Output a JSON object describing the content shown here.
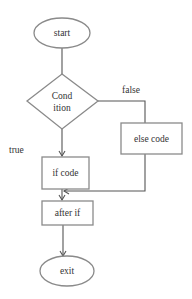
{
  "diagram": {
    "type": "flowchart",
    "nodes": {
      "start": {
        "shape": "ellipse",
        "label": "start"
      },
      "condition": {
        "shape": "diamond",
        "label_line1": "Cond",
        "label_line2": "ition"
      },
      "if_code": {
        "shape": "rect",
        "label": "if code"
      },
      "else_code": {
        "shape": "rect",
        "label": "else code"
      },
      "after_if": {
        "shape": "rect",
        "label": "after if"
      },
      "exit": {
        "shape": "ellipse",
        "label": "exit"
      }
    },
    "edges": [
      {
        "from": "start",
        "to": "condition",
        "label": ""
      },
      {
        "from": "condition",
        "to": "if_code",
        "label": "true"
      },
      {
        "from": "condition",
        "to": "else_code",
        "label": "false"
      },
      {
        "from": "if_code",
        "to": "after_if",
        "label": ""
      },
      {
        "from": "else_code",
        "to": "after_if",
        "label": ""
      },
      {
        "from": "after_if",
        "to": "exit",
        "label": ""
      }
    ],
    "edge_labels": {
      "true": "true",
      "false": "false"
    },
    "colors": {
      "shape_stroke": "#8a8a8a",
      "line": "#555555",
      "text": "#333333",
      "background": "#ffffff"
    }
  }
}
